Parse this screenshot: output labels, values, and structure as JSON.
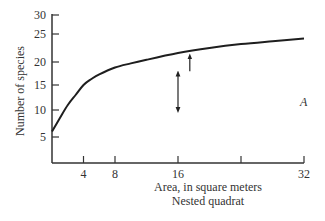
{
  "chart_data": {
    "type": "line",
    "title": "",
    "xlabel": "Area, in square meters",
    "xlabel_sub": "Nested quadrat",
    "ylabel": "Number of species",
    "xlim": [
      0,
      32
    ],
    "ylim": [
      0,
      30
    ],
    "grid": false,
    "legend": null,
    "x_ticks": [
      4,
      8,
      16,
      24,
      32
    ],
    "x_tick_labels": [
      "4",
      "8",
      "16",
      "",
      "32"
    ],
    "y_ticks": [
      5,
      10,
      15,
      20,
      25,
      30
    ],
    "y_tick_labels": [
      "5",
      "10",
      "15",
      "20",
      "25",
      "30"
    ],
    "series": [
      {
        "name": "Species-area curve",
        "x": [
          0,
          1,
          2,
          3,
          4,
          5,
          6,
          8,
          10,
          12,
          16,
          20,
          24,
          28,
          32
        ],
        "y": [
          6,
          8.5,
          11,
          13,
          15,
          16.3,
          17.3,
          18.8,
          19.7,
          20.4,
          21.6,
          22.5,
          23.2,
          23.7,
          24.2
        ]
      }
    ],
    "annotations": [
      {
        "type": "double-arrow",
        "x": 16,
        "y_from": 10,
        "y_to": 17.5
      },
      {
        "type": "up-arrow",
        "x": 17.5,
        "y_from": 18,
        "y_to": 21
      },
      {
        "type": "text",
        "text": "A",
        "x": 32,
        "y": 12
      }
    ]
  },
  "labels": {
    "xlabel": "Area, in square meters",
    "xlabel_sub": "Nested quadrat",
    "ylabel": "Number of species",
    "panel": "A"
  }
}
